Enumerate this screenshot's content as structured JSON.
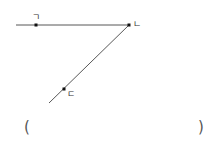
{
  "diagram": {
    "lines": [
      {
        "name": "horizontal-line",
        "x1": 16,
        "y1": 25,
        "x2": 130,
        "y2": 25
      },
      {
        "name": "diagonal-line",
        "x1": 129,
        "y1": 25,
        "x2": 49,
        "y2": 103
      }
    ],
    "points": [
      {
        "label": "ㄱ",
        "x": 36,
        "y": 25
      },
      {
        "label": "ㄴ",
        "x": 129,
        "y": 25
      },
      {
        "label": "ㄷ",
        "x": 64,
        "y": 89
      }
    ],
    "labels": {
      "p1": "ㄱ",
      "p2": "ㄴ",
      "p3": "ㄷ"
    },
    "line_color": "#333333"
  },
  "answer": {
    "open": "(",
    "close": ")"
  }
}
